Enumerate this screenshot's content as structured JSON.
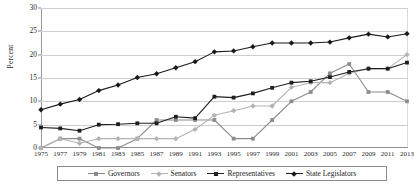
{
  "chart_data": {
    "type": "line",
    "title": "",
    "xlabel": "",
    "ylabel": "Percent",
    "ylim": [
      0,
      30
    ],
    "ytick_step": 5,
    "yticks": [
      "0",
      "5",
      "10",
      "15",
      "20",
      "25",
      "30"
    ],
    "grid": true,
    "legend_position": "bottom",
    "categories": [
      "1975",
      "1977",
      "1979",
      "1981",
      "1983",
      "1985",
      "1987",
      "1989",
      "1991",
      "1993",
      "1995",
      "1997",
      "1999",
      "2001",
      "2003",
      "2005",
      "2007",
      "2009",
      "2011",
      "2013"
    ],
    "series": [
      {
        "name": "Governors",
        "color": "#8c8c8c",
        "marker": "square",
        "values": [
          0.0,
          2.0,
          2.0,
          0.0,
          0.0,
          2.0,
          6.0,
          6.0,
          6.0,
          6.0,
          2.0,
          2.0,
          6.0,
          10.0,
          12.0,
          16.0,
          18.0,
          12.0,
          12.0,
          10.0
        ]
      },
      {
        "name": "Senators",
        "color": "#b3b3b3",
        "marker": "diamond",
        "values": [
          0.0,
          2.0,
          1.0,
          2.0,
          2.0,
          2.0,
          2.0,
          2.0,
          4.0,
          7.0,
          8.0,
          9.0,
          9.0,
          13.0,
          14.0,
          14.0,
          16.0,
          17.0,
          17.0,
          20.0
        ]
      },
      {
        "name": "Representatives",
        "color": "#1f1f1f",
        "marker": "square",
        "values": [
          4.4,
          4.2,
          3.7,
          5.0,
          5.1,
          5.3,
          5.3,
          6.7,
          6.4,
          11.0,
          10.8,
          11.7,
          12.9,
          14.0,
          14.3,
          15.2,
          16.3,
          17.0,
          17.0,
          18.3
        ]
      },
      {
        "name": "State Legislators",
        "color": "#1a1a1a",
        "marker": "diamond",
        "values": [
          8.2,
          9.4,
          10.4,
          12.3,
          13.5,
          15.1,
          15.9,
          17.2,
          18.5,
          20.6,
          20.8,
          21.7,
          22.5,
          22.5,
          22.5,
          22.7,
          23.6,
          24.4,
          23.8,
          24.5
        ]
      }
    ]
  },
  "legend": {
    "items": [
      {
        "label": "Governors"
      },
      {
        "label": "Senators"
      },
      {
        "label": "Representatives"
      },
      {
        "label": "State Legislators"
      }
    ]
  }
}
